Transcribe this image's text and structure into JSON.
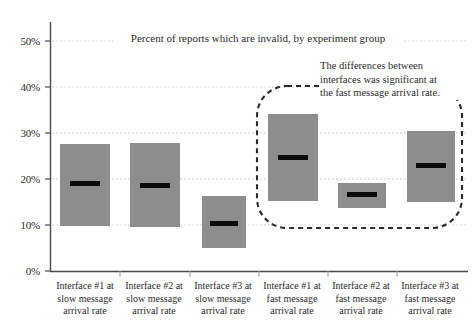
{
  "chart_data": {
    "type": "bar",
    "title": "Percent of reports which are invalid, by experiment group",
    "xlabel": "",
    "ylabel": "",
    "ylim": [
      0,
      55
    ],
    "grid": true,
    "legend": "none",
    "value_format": "percent",
    "y_ticks": [
      "0%",
      "10%",
      "20%",
      "30%",
      "40%",
      "50%"
    ],
    "y_tick_values": [
      0,
      10,
      20,
      30,
      40,
      50
    ],
    "categories": [
      "Interface #1 at slow message arrival rate",
      "Interface #2 at slow message arrival rate",
      "Interface #3 at slow message arrival rate",
      "Interface #1 at fast message arrival rate",
      "Interface #2 at fast message arrival rate",
      "Interface #3 at fast message arrival rate"
    ],
    "category_lines": [
      [
        "Interface #1 at",
        "slow message",
        "arrival rate"
      ],
      [
        "Interface #2 at",
        "slow message",
        "arrival rate"
      ],
      [
        "Interface #3 at",
        "slow message",
        "arrival rate"
      ],
      [
        "Interface #1 at",
        "fast message",
        "arrival rate"
      ],
      [
        "Interface #2 at",
        "fast message",
        "arrival rate"
      ],
      [
        "Interface #3 at",
        "fast message",
        "arrival rate"
      ]
    ],
    "series": [
      {
        "name": "range high",
        "values": [
          27.6,
          27.9,
          16.3,
          34.1,
          19.3,
          30.4
        ]
      },
      {
        "name": "range low",
        "values": [
          9.8,
          9.6,
          5.2,
          15.4,
          13.7,
          15.0
        ]
      },
      {
        "name": "median",
        "values": [
          19.1,
          18.7,
          10.4,
          24.8,
          16.7,
          23.0
        ]
      }
    ],
    "annotations": [
      {
        "id": "fast-rate-callout",
        "text": "The differences between interfaces was significant at the fast message arrival rate.",
        "lines": [
          "The differences between",
          "interfaces was significant at",
          "the fast message arrival rate."
        ],
        "shape": "dashed-rounded-rectangle",
        "covers_categories": [
          3,
          4,
          5
        ]
      }
    ],
    "colors": {
      "box_fill": "#8d8d8d",
      "median": "#0a0a0a",
      "axis": "#4a4a4a",
      "grid": "#cfcfcf",
      "text": "#2b2b2b",
      "annotation_outline": "#2b2b2b"
    }
  }
}
